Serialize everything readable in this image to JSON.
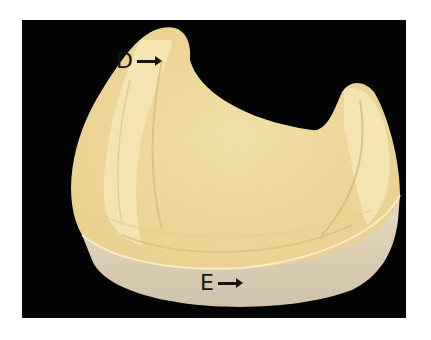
{
  "figure": {
    "background_color": "#040404",
    "page_color": "#ffffff",
    "colors": {
      "stone_light": "#f3e2ab",
      "stone_mid": "#e9d08e",
      "stone_shadow": "#c8b07a",
      "base_side": "#d9cdb6"
    },
    "labels": [
      {
        "id": "D",
        "text": "D",
        "arrow": "right-arrow"
      },
      {
        "id": "E",
        "text": "E",
        "arrow": "right-arrow"
      }
    ]
  }
}
